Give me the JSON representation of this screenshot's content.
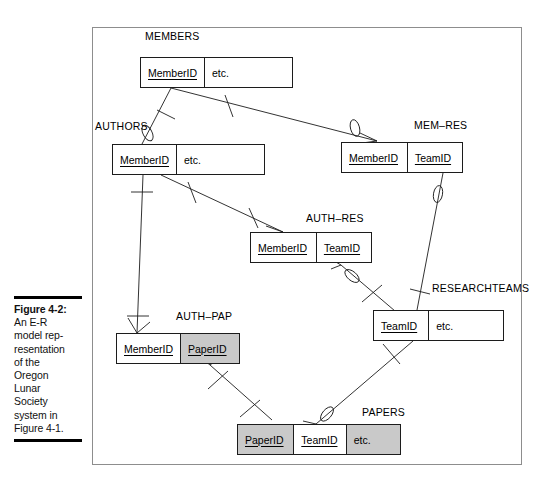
{
  "figure": {
    "caption_label": "Figure 4-2:",
    "caption_body": "An E-R model rep-resentation of the Oregon Lunar Society system in Figure 4-1.",
    "caption_lines": [
      "An E-R",
      "model rep-",
      "resentation",
      "of the",
      "Oregon",
      "Lunar",
      "Society",
      "system in",
      "Figure 4-1."
    ]
  },
  "diagram": {
    "type": "er-diagram",
    "notation": "crows-foot",
    "entities": [
      {
        "id": "members",
        "name": "MEMBERS",
        "attributes": [
          {
            "text": "MemberID",
            "key": true,
            "shaded": false
          },
          {
            "text": "etc.",
            "key": false,
            "shaded": false
          }
        ]
      },
      {
        "id": "authors",
        "name": "AUTHORS",
        "attributes": [
          {
            "text": "MemberID",
            "key": true,
            "shaded": false
          },
          {
            "text": "etc.",
            "key": false,
            "shaded": false
          }
        ]
      },
      {
        "id": "mem-res",
        "name": "MEM–RES",
        "attributes": [
          {
            "text": "MemberID",
            "key": true,
            "shaded": false
          },
          {
            "text": "TeamID",
            "key": true,
            "shaded": false
          }
        ]
      },
      {
        "id": "auth-res",
        "name": "AUTH–RES",
        "attributes": [
          {
            "text": "MemberID",
            "key": true,
            "shaded": false
          },
          {
            "text": "TeamID",
            "key": true,
            "shaded": false
          }
        ]
      },
      {
        "id": "researchteams",
        "name": "RESEARCHTEAMS",
        "attributes": [
          {
            "text": "TeamID",
            "key": true,
            "shaded": false
          },
          {
            "text": "etc.",
            "key": false,
            "shaded": false
          }
        ]
      },
      {
        "id": "auth-pap",
        "name": "AUTH–PAP",
        "attributes": [
          {
            "text": "MemberID",
            "key": true,
            "shaded": false
          },
          {
            "text": "PaperID",
            "key": true,
            "shaded": true
          }
        ]
      },
      {
        "id": "papers",
        "name": "PAPERS",
        "attributes": [
          {
            "text": "PaperID",
            "key": true,
            "shaded": true
          },
          {
            "text": "TeamID",
            "key": true,
            "shaded": false
          },
          {
            "text": "etc.",
            "key": false,
            "shaded": true
          }
        ]
      }
    ],
    "relationships": [
      {
        "from": "members",
        "to": "authors",
        "from_card": "one",
        "to_card": "zero-or-one"
      },
      {
        "from": "members",
        "to": "mem-res",
        "from_card": "one",
        "to_card": "zero-or-many"
      },
      {
        "from": "authors",
        "to": "auth-res",
        "from_card": "one",
        "to_card": "many"
      },
      {
        "from": "authors",
        "to": "auth-pap",
        "from_card": "one",
        "to_card": "many"
      },
      {
        "from": "mem-res",
        "to": "researchteams",
        "from_card": "zero-or-many",
        "to_card": "one"
      },
      {
        "from": "auth-res",
        "to": "researchteams",
        "from_card": "zero-or-many",
        "to_card": "one"
      },
      {
        "from": "auth-pap",
        "to": "papers",
        "from_card": "many",
        "to_card": "many"
      },
      {
        "from": "researchteams",
        "to": "papers",
        "from_card": "one",
        "to_card": "zero-or-many"
      }
    ]
  },
  "colors": {
    "shaded_fill": "#c9c9c9",
    "line": "#1c1c1c",
    "frame": "#8d8d8d",
    "text": "#000000"
  }
}
